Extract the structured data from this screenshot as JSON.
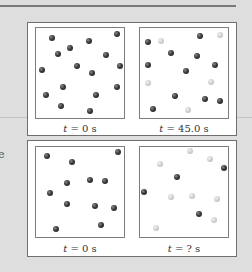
{
  "side_text": "e",
  "figures": [
    {
      "panels": [
        {
          "label_var": "t",
          "label_rest": " = 0 s",
          "balls": [
            {
              "x": 16,
              "y": 10,
              "c": "dark"
            },
            {
              "x": 81,
              "y": 6,
              "c": "dark"
            },
            {
              "x": 53,
              "y": 13,
              "c": "dark"
            },
            {
              "x": 34,
              "y": 20,
              "c": "dark"
            },
            {
              "x": 22,
              "y": 26,
              "c": "dark"
            },
            {
              "x": 70,
              "y": 27,
              "c": "dark"
            },
            {
              "x": 6,
              "y": 42,
              "c": "dark"
            },
            {
              "x": 41,
              "y": 38,
              "c": "dark"
            },
            {
              "x": 56,
              "y": 45,
              "c": "dark"
            },
            {
              "x": 84,
              "y": 38,
              "c": "dark"
            },
            {
              "x": 27,
              "y": 59,
              "c": "dark"
            },
            {
              "x": 81,
              "y": 59,
              "c": "dark"
            },
            {
              "x": 10,
              "y": 67,
              "c": "dark"
            },
            {
              "x": 60,
              "y": 67,
              "c": "dark"
            },
            {
              "x": 25,
              "y": 78,
              "c": "dark"
            },
            {
              "x": 54,
              "y": 83,
              "c": "dark"
            }
          ]
        },
        {
          "label_var": "t",
          "label_rest": " = 45.0 s",
          "balls": [
            {
              "x": 8,
              "y": 14,
              "c": "dark"
            },
            {
              "x": 60,
              "y": 8,
              "c": "dark"
            },
            {
              "x": 31,
              "y": 25,
              "c": "dark"
            },
            {
              "x": 57,
              "y": 28,
              "c": "dark"
            },
            {
              "x": 8,
              "y": 37,
              "c": "dark"
            },
            {
              "x": 75,
              "y": 37,
              "c": "dark"
            },
            {
              "x": 46,
              "y": 43,
              "c": "dark"
            },
            {
              "x": 35,
              "y": 68,
              "c": "dark"
            },
            {
              "x": 65,
              "y": 71,
              "c": "dark"
            },
            {
              "x": 80,
              "y": 73,
              "c": "dark"
            },
            {
              "x": 13,
              "y": 81,
              "c": "dark"
            },
            {
              "x": 21,
              "y": 13,
              "c": "light"
            },
            {
              "x": 80,
              "y": 7,
              "c": "light"
            },
            {
              "x": 8,
              "y": 55,
              "c": "light"
            },
            {
              "x": 71,
              "y": 54,
              "c": "light"
            },
            {
              "x": 48,
              "y": 82,
              "c": "light"
            }
          ]
        }
      ]
    },
    {
      "panels": [
        {
          "label_var": "t",
          "label_rest": " = 0 s",
          "balls": [
            {
              "x": 11,
              "y": 9,
              "c": "dark"
            },
            {
              "x": 82,
              "y": 5,
              "c": "dark"
            },
            {
              "x": 36,
              "y": 15,
              "c": "dark"
            },
            {
              "x": 31,
              "y": 36,
              "c": "dark"
            },
            {
              "x": 54,
              "y": 33,
              "c": "dark"
            },
            {
              "x": 69,
              "y": 34,
              "c": "dark"
            },
            {
              "x": 14,
              "y": 46,
              "c": "dark"
            },
            {
              "x": 31,
              "y": 57,
              "c": "dark"
            },
            {
              "x": 59,
              "y": 59,
              "c": "dark"
            },
            {
              "x": 78,
              "y": 61,
              "c": "dark"
            },
            {
              "x": 20,
              "y": 82,
              "c": "dark"
            },
            {
              "x": 65,
              "y": 78,
              "c": "dark"
            }
          ]
        },
        {
          "label_var": "t",
          "label_rest": " = ? s",
          "balls": [
            {
              "x": 84,
              "y": 21,
              "c": "dark"
            },
            {
              "x": 37,
              "y": 30,
              "c": "dark"
            },
            {
              "x": 4,
              "y": 45,
              "c": "dark"
            },
            {
              "x": 59,
              "y": 67,
              "c": "dark"
            },
            {
              "x": 50,
              "y": 4,
              "c": "light"
            },
            {
              "x": 20,
              "y": 17,
              "c": "light"
            },
            {
              "x": 70,
              "y": 12,
              "c": "light"
            },
            {
              "x": 31,
              "y": 50,
              "c": "light"
            },
            {
              "x": 52,
              "y": 49,
              "c": "light"
            },
            {
              "x": 77,
              "y": 52,
              "c": "light"
            },
            {
              "x": 74,
              "y": 73,
              "c": "light"
            },
            {
              "x": 16,
              "y": 81,
              "c": "light"
            }
          ]
        }
      ]
    }
  ]
}
